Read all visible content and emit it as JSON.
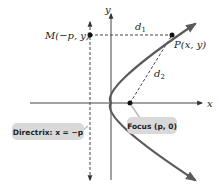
{
  "diagram": {
    "type": "parabola-definition",
    "axes": {
      "x_label": "x",
      "y_label": "y"
    },
    "points": {
      "M": {
        "label": "M(−p, y)"
      },
      "P": {
        "label": "P(x, y)"
      },
      "focus": {
        "label": "Focus (p, 0)"
      }
    },
    "distances": {
      "d1": "d",
      "d1_sub": "1",
      "d2": "d",
      "d2_sub": "2"
    },
    "directrix": {
      "label": "Directrix: x = −p"
    },
    "colors": {
      "curve": "#5a5a5a",
      "axes": "#333333",
      "dashed": "#444444",
      "callout_bg": "#d9d9d9"
    }
  }
}
